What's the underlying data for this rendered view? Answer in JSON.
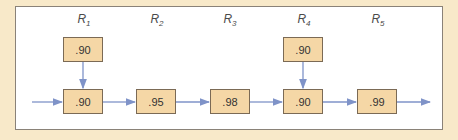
{
  "diagram": {
    "labels": [
      {
        "name": "R",
        "sub": "1",
        "x": 84
      },
      {
        "name": "R",
        "sub": "2",
        "x": 157
      },
      {
        "name": "R",
        "sub": "3",
        "x": 230
      },
      {
        "name": "R",
        "sub": "4",
        "x": 304
      },
      {
        "name": "R",
        "sub": "5",
        "x": 378
      }
    ],
    "top_boxes": [
      {
        "value": ".90",
        "x": 63
      },
      {
        "value": ".90",
        "x": 283
      }
    ],
    "main_boxes": [
      {
        "value": ".90",
        "x": 63
      },
      {
        "value": ".95",
        "x": 136
      },
      {
        "value": ".98",
        "x": 210
      },
      {
        "value": ".90",
        "x": 283
      },
      {
        "value": ".99",
        "x": 357
      }
    ],
    "colors": {
      "background": "#f8e9c9",
      "box_fill": "#f5d7a6",
      "arrow": "#7f93c8"
    }
  }
}
